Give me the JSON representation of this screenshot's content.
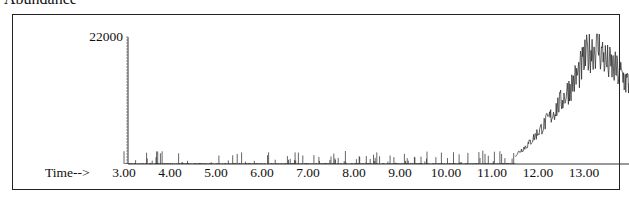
{
  "title": "Abundance",
  "chart_data": {
    "type": "line",
    "title": "Abundance",
    "xlabel": "Time-->",
    "ylabel": "",
    "y_tick_labels": [
      "22000"
    ],
    "ylim": [
      0,
      22000
    ],
    "xlim": [
      2.9,
      14.0
    ],
    "x_ticks": [
      3.0,
      4.0,
      5.0,
      6.0,
      7.0,
      8.0,
      9.0,
      10.0,
      11.0,
      12.0,
      13.0
    ],
    "x_tick_labels": [
      "3.00",
      "4.00",
      "5.00",
      "6.00",
      "7.00",
      "8.00",
      "9.00",
      "10.00",
      "11.00",
      "12.00",
      "13.00"
    ],
    "grid": false,
    "legend": null,
    "series": [
      {
        "name": "TIC",
        "description": "Noisy baseline (<~2500) from 3.0 to 11.5 min, then rising broad hump peaking ~20000-22000 near 13.1-13.3 min, ending ~14000 at 14.0 min",
        "x": [
          3.0,
          4.0,
          5.0,
          6.0,
          7.0,
          8.0,
          9.0,
          10.0,
          11.0,
          11.5,
          11.8,
          12.0,
          12.3,
          12.6,
          12.9,
          13.1,
          13.3,
          13.5,
          13.8,
          14.0
        ],
        "y": [
          500,
          600,
          800,
          500,
          700,
          500,
          500,
          300,
          700,
          1500,
          3500,
          5500,
          8500,
          12000,
          16000,
          19500,
          20500,
          17500,
          15500,
          13500
        ]
      }
    ]
  }
}
